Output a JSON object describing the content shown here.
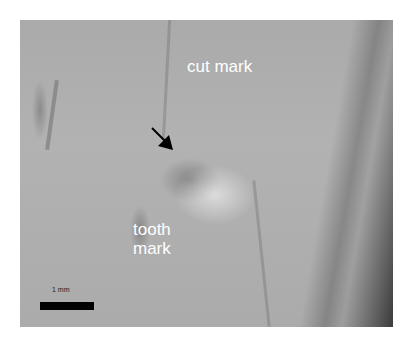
{
  "image": {
    "description": "Grayscale micrograph of bone surface showing a cut mark and a tooth mark",
    "annotations": {
      "cut_mark_label": "cut mark",
      "tooth_mark_label_line1": "tooth",
      "tooth_mark_label_line2": "mark",
      "scale_label": "1 mm"
    },
    "colors": {
      "label_text": "#ffffff",
      "scale_bar": "#000000",
      "arrow": "#000000"
    }
  }
}
